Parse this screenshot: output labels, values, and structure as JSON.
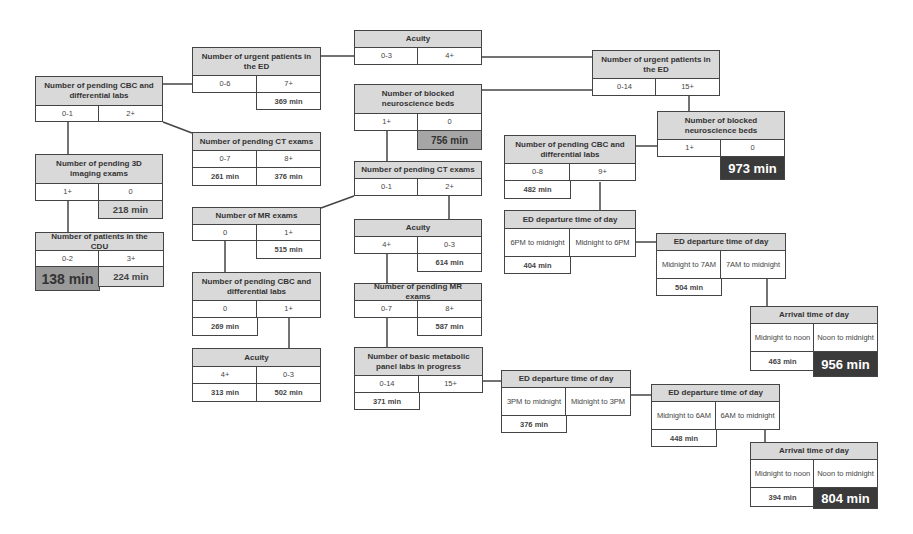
{
  "diagram": {
    "type": "decision-tree",
    "nodes": {
      "acuity_root": {
        "title": "Acuity",
        "left": "0-3",
        "right": "4+"
      },
      "urgent_left": {
        "title": "Number of urgent patients in the ED",
        "left": "0-6",
        "right": "7+",
        "right_result": "369 min"
      },
      "cbc_top_left": {
        "title": "Number of pending CBC and differential labs",
        "left": "0-1",
        "right": "2+"
      },
      "ct_left": {
        "title": "Number of pending CT exams",
        "left": "0-7",
        "right": "8+",
        "left_result": "261 min",
        "right_result": "376 min"
      },
      "imaging3d": {
        "title": "Number of pending 3D imaging exams",
        "left": "1+",
        "right": "0",
        "right_result": "218 min"
      },
      "cdu": {
        "title": "Number of patients in the CDU",
        "left": "0-2",
        "right": "3+",
        "left_result": "138 min",
        "right_result": "224 min"
      },
      "blocked_mid": {
        "title": "Number of blocked neuroscience beds",
        "left": "1+",
        "right": "0",
        "right_result": "756 min"
      },
      "ct_mid": {
        "title": "Number of pending CT exams",
        "left": "0-1",
        "right": "2+"
      },
      "mr_left": {
        "title": "Number of MR exams",
        "left": "0",
        "right": "1+",
        "right_result": "515 min"
      },
      "cbc_mid_left": {
        "title": "Number of pending CBC and differential labs",
        "left": "0",
        "right": "1+",
        "left_result": "269 min"
      },
      "acuity_low_left": {
        "title": "Acuity",
        "left": "4+",
        "right": "0-3",
        "left_result": "313 min",
        "right_result": "502 min"
      },
      "acuity_mid": {
        "title": "Acuity",
        "left": "4+",
        "right": "0-3",
        "right_result": "614 min"
      },
      "mr_pending_mid": {
        "title": "Number of pending MR exams",
        "left": "0-7",
        "right": "8+",
        "right_result": "587 min"
      },
      "bmp": {
        "title": "Number of basic metabolic panel labs in progress",
        "left": "0-14",
        "right": "15+",
        "left_result": "371 min"
      },
      "urgent_right": {
        "title": "Number of urgent patients in the ED",
        "left": "0-14",
        "right": "15+"
      },
      "blocked_right": {
        "title": "Number of blocked neuroscience beds",
        "left": "1+",
        "right": "0",
        "right_result": "973 min"
      },
      "cbc_right": {
        "title": "Number of pending CBC and differential labs",
        "left": "0-8",
        "right": "9+",
        "left_result": "482 min"
      },
      "ed_dep_1": {
        "title": "ED departure time of day",
        "left": "6PM to midnight",
        "right": "Midnight to 6PM",
        "left_result": "404 min"
      },
      "ed_dep_2": {
        "title": "ED departure time of day",
        "left": "Midnight to 7AM",
        "right": "7AM to midnight",
        "left_result": "504 min"
      },
      "arrival_1": {
        "title": "Arrival time of day",
        "left": "Midnight to noon",
        "right": "Noon to midnight",
        "left_result": "463 min",
        "right_result": "956 min"
      },
      "ed_dep_3": {
        "title": "ED departure time of day",
        "left": "3PM to midnight",
        "right": "Midnight to 3PM",
        "left_result": "376 min"
      },
      "ed_dep_4": {
        "title": "ED departure time of day",
        "left": "Midnight to 6AM",
        "right": "6AM to midnight",
        "left_result": "448 min"
      },
      "arrival_2": {
        "title": "Arrival time of day",
        "left": "Midnight to noon",
        "right": "Noon to midnight",
        "left_result": "394 min",
        "right_result": "804 min"
      }
    },
    "colors": {
      "header": "#d9d9d9",
      "border": "#444444",
      "dark_result": "#3a3a3a",
      "mid_result": "#a6a6a6"
    }
  }
}
